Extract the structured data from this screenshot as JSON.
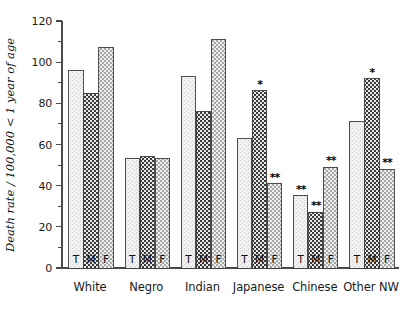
{
  "chart_data": {
    "type": "bar",
    "title": "",
    "subtitle": "",
    "xlabel": "",
    "ylabel": "Death rate / 100,000 < 1 year of age",
    "ylim": [
      0,
      120
    ],
    "yticks": [
      0,
      20,
      40,
      60,
      80,
      100,
      120
    ],
    "ytick_labels": [
      "0",
      "20",
      "40",
      "60",
      "80",
      "100",
      "120"
    ],
    "minor_ticks": [
      10,
      30,
      50,
      70,
      90,
      110
    ],
    "grid": false,
    "legend_position": "none",
    "categories": [
      "White",
      "Negro",
      "Indian",
      "Japanese",
      "Chinese",
      "Other NW"
    ],
    "series_names": [
      "T",
      "M",
      "F"
    ],
    "series": [
      {
        "name": "T",
        "label": "T",
        "values": [
          96,
          53,
          93,
          63,
          35,
          71
        ]
      },
      {
        "name": "M",
        "label": "M",
        "values": [
          85,
          54,
          76,
          86,
          27,
          92
        ]
      },
      {
        "name": "F",
        "label": "F",
        "values": [
          107,
          53,
          111,
          41,
          49,
          48
        ]
      }
    ],
    "annotations": [
      {
        "category": "Japanese",
        "series": "M",
        "mark": "*"
      },
      {
        "category": "Japanese",
        "series": "F",
        "mark": "**"
      },
      {
        "category": "Chinese",
        "series": "T",
        "mark": "**"
      },
      {
        "category": "Chinese",
        "series": "M",
        "mark": "**"
      },
      {
        "category": "Chinese",
        "series": "F",
        "mark": "**"
      },
      {
        "category": "Other NW",
        "series": "M",
        "mark": "*"
      },
      {
        "category": "Other NW",
        "series": "F",
        "mark": "**"
      }
    ],
    "fill_styles": {
      "T": "light-dotted",
      "M": "dark-checker",
      "F": "diagonal-hatch"
    },
    "colors": {
      "axis": "#4a4a4a",
      "text": "#1a1a1a",
      "bar_outline": "#3c3c3c",
      "background": "#ffffff"
    }
  }
}
